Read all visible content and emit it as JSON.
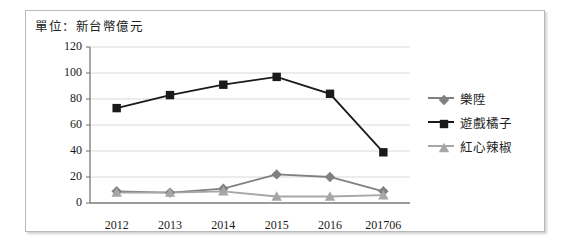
{
  "chart_data": {
    "type": "line",
    "title": "單位：新台幣億元",
    "xlabel": "",
    "ylabel": "",
    "categories": [
      "2012",
      "2013",
      "2014",
      "2015",
      "2016",
      "201706"
    ],
    "ylim": [
      0,
      120
    ],
    "yticks": [
      0,
      20,
      40,
      60,
      80,
      100,
      120
    ],
    "grid": true,
    "legend_position": "right",
    "series": [
      {
        "name": "樂陞",
        "marker": "diamond",
        "color": "#808080",
        "values": [
          9,
          8,
          11,
          22,
          20,
          9
        ]
      },
      {
        "name": "遊戲橘子",
        "marker": "square",
        "color": "#1a1a1a",
        "values": [
          73,
          83,
          91,
          97,
          84,
          39
        ]
      },
      {
        "name": "紅心辣椒",
        "marker": "triangle",
        "color": "#a6a6a6",
        "values": [
          8,
          8,
          9,
          5,
          5,
          6
        ]
      }
    ]
  },
  "axis": {
    "y_labels": [
      "120",
      "100",
      "80",
      "60",
      "40",
      "20",
      "0"
    ],
    "x_labels": [
      "2012",
      "2013",
      "2014",
      "2015",
      "2016",
      "201706"
    ]
  },
  "legend": {
    "items": [
      {
        "label": "樂陞"
      },
      {
        "label": "遊戲橘子"
      },
      {
        "label": "紅心辣椒"
      }
    ]
  },
  "colors": {
    "series_1": "#808080",
    "series_2": "#1a1a1a",
    "series_3": "#a6a6a6",
    "grid": "#d9d9d9",
    "axis": "#808080",
    "border": "#b9b9b9"
  }
}
